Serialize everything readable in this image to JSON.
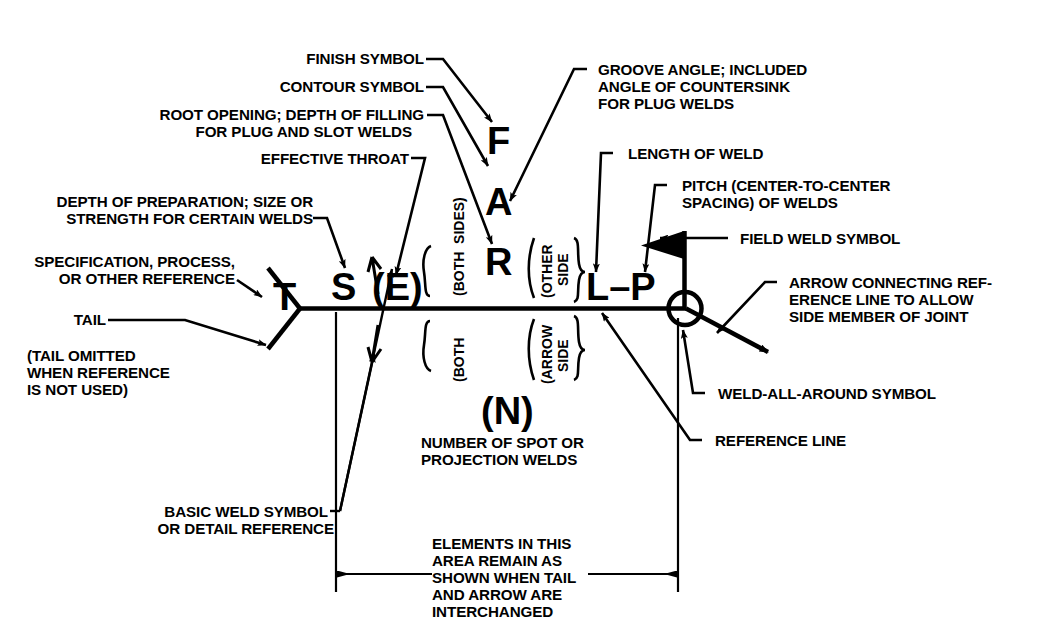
{
  "diagram": {
    "background_color": "#ffffff",
    "ink_color": "#000000"
  },
  "labels": {
    "finish_symbol": "FINISH SYMBOL",
    "contour_symbol": "CONTOUR SYMBOL",
    "root_opening_1": "ROOT OPENING; DEPTH OF FILLING",
    "root_opening_2": "FOR PLUG AND SLOT WELDS",
    "effective_throat": "EFFECTIVE THROAT",
    "depth_prep_1": "DEPTH OF PREPARATION; SIZE OR",
    "depth_prep_2": "STRENGTH FOR CERTAIN WELDS",
    "spec_1": "SPECIFICATION, PROCESS,",
    "spec_2": "OR OTHER REFERENCE",
    "tail": "TAIL",
    "tail_omitted_1": "(TAIL OMITTED",
    "tail_omitted_2": "WHEN REFERENCE",
    "tail_omitted_3": "IS NOT USED)",
    "basic_weld_1": "BASIC WELD SYMBOL",
    "basic_weld_2": "OR DETAIL REFERENCE",
    "groove_angle_1": "GROOVE ANGLE; INCLUDED",
    "groove_angle_2": "ANGLE OF COUNTERSINK",
    "groove_angle_3": "FOR PLUG WELDS",
    "length_of_weld": "LENGTH OF WELD",
    "pitch_1": "PITCH (CENTER-TO-CENTER",
    "pitch_2": "SPACING) OF WELDS",
    "field_weld": "FIELD WELD SYMBOL",
    "arrow_conn_1": "ARROW CONNECTING REF-",
    "arrow_conn_2": "ERENCE LINE TO ALLOW",
    "arrow_conn_3": "SIDE MEMBER OF JOINT",
    "weld_all_around": "WELD-ALL-AROUND SYMBOL",
    "reference_line": "REFERENCE LINE",
    "number_spot_1": "NUMBER OF SPOT OR",
    "number_spot_2": "PROJECTION WELDS",
    "elements_1": "ELEMENTS IN THIS",
    "elements_2": "AREA REMAIN AS",
    "elements_3": "SHOWN WHEN TAIL",
    "elements_4": "AND ARROW ARE",
    "elements_5": "INTERCHANGED"
  },
  "symbols": {
    "tail_letter": "T",
    "size_letter": "S",
    "throat_letter": "(E)",
    "finish_letter": "F",
    "contour_letter": "A",
    "root_letter": "R",
    "length_pitch": "L–P",
    "number_letter": "(N)"
  },
  "bracket_labels": {
    "both_sides_upper": "(BOTH  SIDES)",
    "both_sides_lower": "(BOTH",
    "other_side_1": "(OTHER",
    "other_side_2": "SIDE",
    "arrow_side_1": "(ARROW",
    "arrow_side_2": "SIDE"
  },
  "icon_names": {
    "field_weld_flag": "field-weld-flag-icon",
    "weld_all_around_circle": "weld-all-around-circle-icon",
    "leader_arrow": "leader-arrow-icon",
    "dimension_arrow": "dimension-arrow-icon",
    "tail_fork": "tail-fork-icon"
  }
}
